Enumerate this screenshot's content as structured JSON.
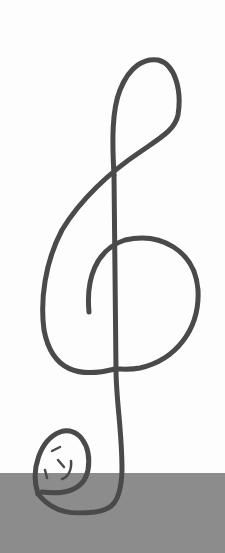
{
  "image": {
    "subject": "hand-drawn treble clef",
    "colors": {
      "background": "#fdfdfd",
      "stroke": "#4a4a4a",
      "ground": "#8c8c8c"
    }
  }
}
